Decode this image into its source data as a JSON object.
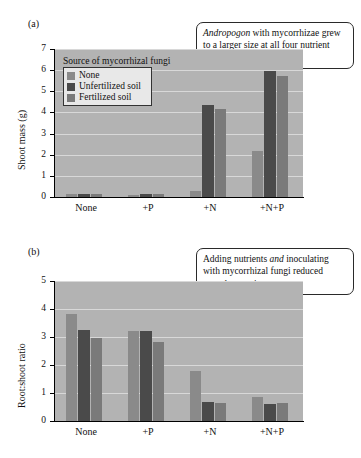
{
  "figure": {
    "panels": [
      {
        "label": "(a)",
        "callout_parts": [
          {
            "text": "Andropogon",
            "italic": true
          },
          {
            "text": " with mycorrhizae grew to a larger size at all four nutrient levels.",
            "italic": false
          }
        ],
        "legend": {
          "title": "Source of mycorrhizal fungi",
          "items": [
            "None",
            "Unfertilized soil",
            "Fertilized soil"
          ]
        }
      },
      {
        "label": "(b)",
        "callout_parts": [
          {
            "text": "Adding nutrients ",
            "italic": false
          },
          {
            "text": "and",
            "italic": true
          },
          {
            "text": " inoculating with mycorrhizal fungi reduced root:shoot ratios.",
            "italic": false
          }
        ]
      }
    ]
  },
  "colors": {
    "series_none": "#8a8a8a",
    "series_unfertilized": "#4a4a4a",
    "series_fertilized": "#7a7a7a",
    "plot_background": "#b3b3b3",
    "gridline": "#d8d8d8",
    "axis": "#000000"
  },
  "chart_data": [
    {
      "type": "bar",
      "panel": "(a)",
      "title": "",
      "xlabel": "",
      "ylabel": "Shoot mass (g)",
      "categories": [
        "None",
        "+P",
        "+N",
        "+N+P"
      ],
      "ylim": [
        0,
        7
      ],
      "yticks": [
        0,
        1,
        2,
        3,
        4,
        5,
        6,
        7
      ],
      "grid": true,
      "legend": "inside-top-left",
      "series": [
        {
          "name": "None",
          "values": [
            0.12,
            0.1,
            0.27,
            2.2
          ]
        },
        {
          "name": "Unfertilized soil",
          "values": [
            0.14,
            0.13,
            4.35,
            5.95
          ]
        },
        {
          "name": "Fertilized soil",
          "values": [
            0.12,
            0.15,
            4.17,
            5.72
          ]
        }
      ]
    },
    {
      "type": "bar",
      "panel": "(b)",
      "title": "",
      "xlabel": "",
      "ylabel": "Root:shoot ratio",
      "categories": [
        "None",
        "+P",
        "+N",
        "+N+P"
      ],
      "ylim": [
        0,
        5
      ],
      "yticks": [
        0,
        1,
        2,
        3,
        4,
        5
      ],
      "grid": true,
      "legend": "none",
      "series": [
        {
          "name": "None",
          "values": [
            3.83,
            3.23,
            1.77,
            0.85
          ]
        },
        {
          "name": "Unfertilized soil",
          "values": [
            3.25,
            3.2,
            0.68,
            0.62
          ]
        },
        {
          "name": "Fertilized soil",
          "values": [
            2.95,
            2.83,
            0.65,
            0.65
          ]
        }
      ]
    }
  ]
}
